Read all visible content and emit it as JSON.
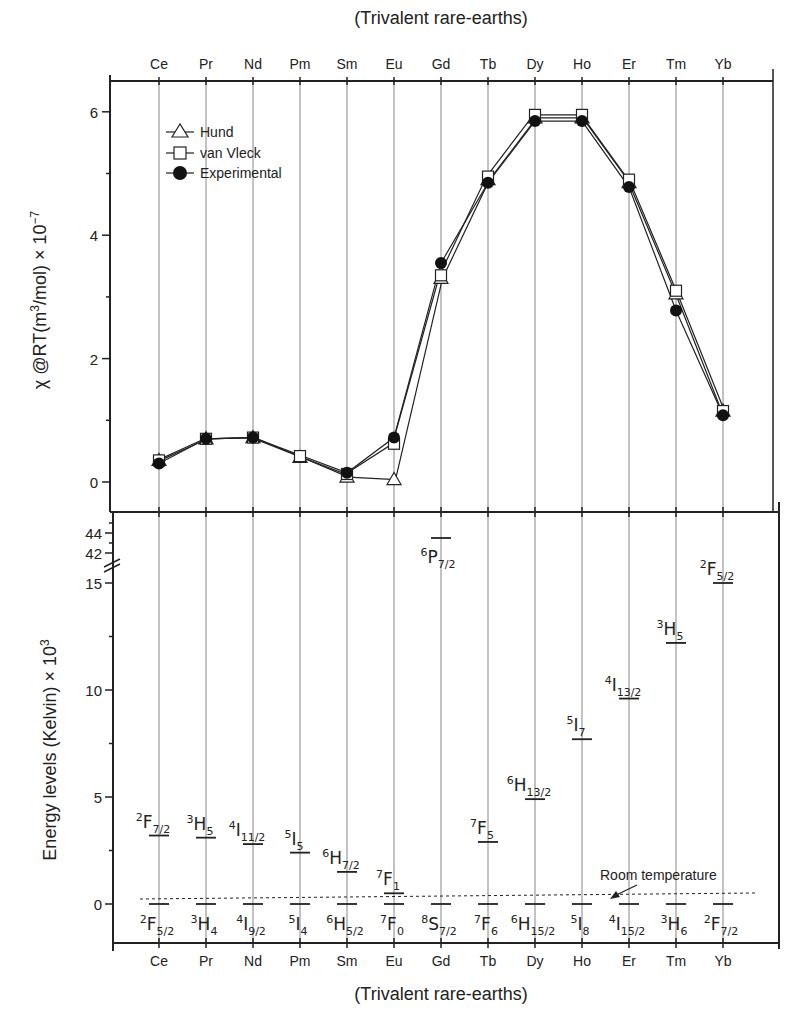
{
  "chart_data": [
    {
      "type": "line",
      "title": "(Trivalent rare-earths)",
      "xlabel": "(Trivalent rare-earths)",
      "ylabel": "χ @RT(m³/mol) × 10⁻⁷",
      "ylim": [
        -0.2,
        6.5
      ],
      "yticks": [
        0,
        2,
        4,
        6
      ],
      "grid": "vertical lines at each element",
      "legend_position": "upper-left",
      "categories": [
        "Ce",
        "Pr",
        "Nd",
        "Pm",
        "Sm",
        "Eu",
        "Gd",
        "Tb",
        "Dy",
        "Ho",
        "Er",
        "Tm",
        "Yb"
      ],
      "series": [
        {
          "name": "Hund",
          "marker": "open-triangle",
          "values": [
            0.35,
            0.7,
            0.72,
            0.4,
            0.08,
            0.04,
            3.3,
            4.9,
            5.9,
            5.9,
            4.85,
            3.05,
            1.15
          ]
        },
        {
          "name": "van Vleck",
          "marker": "open-square",
          "values": [
            0.35,
            0.7,
            0.72,
            0.42,
            0.13,
            0.62,
            3.35,
            4.95,
            5.95,
            5.95,
            4.9,
            3.1,
            1.15
          ]
        },
        {
          "name": "Experimental",
          "marker": "filled-circle",
          "values": [
            0.3,
            0.7,
            0.72,
            null,
            0.15,
            0.72,
            3.55,
            4.85,
            5.85,
            5.85,
            4.78,
            2.78,
            1.08
          ]
        }
      ]
    },
    {
      "type": "energy-levels",
      "xlabel": "(Trivalent rare-earths)",
      "ylabel": "Energy levels (Kelvin) × 10³",
      "ylim": [
        -1.8,
        45
      ],
      "axis_break": [
        15.5,
        42
      ],
      "yticks": [
        0,
        5,
        10,
        15,
        42,
        44
      ],
      "categories": [
        "Ce",
        "Pr",
        "Nd",
        "Pm",
        "Sm",
        "Eu",
        "Gd",
        "Tb",
        "Dy",
        "Ho",
        "Er",
        "Tm",
        "Yb"
      ],
      "ground_states": [
        {
          "element": "Ce",
          "term": "2F5/2",
          "energy": 0
        },
        {
          "element": "Pr",
          "term": "3H4",
          "energy": 0
        },
        {
          "element": "Nd",
          "term": "4I9/2",
          "energy": 0
        },
        {
          "element": "Pm",
          "term": "5I4",
          "energy": 0
        },
        {
          "element": "Sm",
          "term": "6H5/2",
          "energy": 0
        },
        {
          "element": "Eu",
          "term": "7F0",
          "energy": 0
        },
        {
          "element": "Gd",
          "term": "8S7/2",
          "energy": 0
        },
        {
          "element": "Tb",
          "term": "7F6",
          "energy": 0
        },
        {
          "element": "Dy",
          "term": "6H15/2",
          "energy": 0
        },
        {
          "element": "Ho",
          "term": "5I8",
          "energy": 0
        },
        {
          "element": "Er",
          "term": "4I15/2",
          "energy": 0
        },
        {
          "element": "Tm",
          "term": "3H6",
          "energy": 0
        },
        {
          "element": "Yb",
          "term": "2F7/2",
          "energy": 0
        }
      ],
      "excited_states": [
        {
          "element": "Ce",
          "term": "2F7/2",
          "energy": 3.2
        },
        {
          "element": "Pr",
          "term": "3H5",
          "energy": 3.1
        },
        {
          "element": "Nd",
          "term": "4I11/2",
          "energy": 2.8
        },
        {
          "element": "Pm",
          "term": "5I5",
          "energy": 2.4
        },
        {
          "element": "Sm",
          "term": "6H7/2",
          "energy": 1.5
        },
        {
          "element": "Eu",
          "term": "7F1",
          "energy": 0.5
        },
        {
          "element": "Gd",
          "term": "6P7/2",
          "energy": 43.5
        },
        {
          "element": "Tb",
          "term": "7F5",
          "energy": 2.9
        },
        {
          "element": "Dy",
          "term": "6H13/2",
          "energy": 4.9
        },
        {
          "element": "Ho",
          "term": "5I7",
          "energy": 7.7
        },
        {
          "element": "Er",
          "term": "4I13/2",
          "energy": 9.6
        },
        {
          "element": "Tm",
          "term": "3H5",
          "energy": 12.2
        },
        {
          "element": "Yb",
          "term": "2F5/2",
          "energy": 15.0
        }
      ],
      "annotations": [
        {
          "text": "Room temperature",
          "type": "dashed-line",
          "energy": 0.3
        }
      ]
    }
  ],
  "labels": {
    "top_title": "(Trivalent rare-earths)",
    "bottom_title": "(Trivalent rare-earths)",
    "upper_ylabel_main": "χ @RT(m",
    "upper_ylabel_sup1": "3",
    "upper_ylabel_mid": "/mol) × 10",
    "upper_ylabel_sup2": "−7",
    "lower_ylabel_main": "Energy levels (Kelvin) × 10",
    "lower_ylabel_sup": "3",
    "room_temp": "Room temperature",
    "legend": [
      "Hund",
      "van Vleck",
      "Experimental"
    ],
    "upper_yticks": [
      "0",
      "2",
      "4",
      "6"
    ],
    "lower_yticks": [
      "0",
      "5",
      "10",
      "15",
      "42",
      "44"
    ]
  }
}
